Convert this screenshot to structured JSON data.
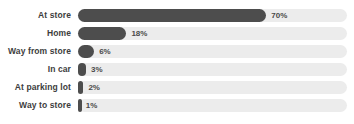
{
  "chart_data": {
    "type": "bar",
    "orientation": "horizontal",
    "title": "",
    "xlabel": "",
    "ylabel": "",
    "xlim": [
      0,
      100
    ],
    "grid": false,
    "legend": null,
    "value_suffix": "%",
    "categories": [
      "At store",
      "Home",
      "Way from store",
      "In car",
      "At parking lot",
      "Way to store"
    ],
    "values": [
      70,
      18,
      6,
      3,
      2,
      1
    ],
    "labels": [
      "70%",
      "18%",
      "6%",
      "3%",
      "2%",
      "1%"
    ],
    "colors": {
      "bar_fill": "#4d4d4d",
      "track": "#ececec",
      "category_text": "#3d3d3d",
      "value_text": "#4a4a4a",
      "background": "#ffffff"
    }
  }
}
